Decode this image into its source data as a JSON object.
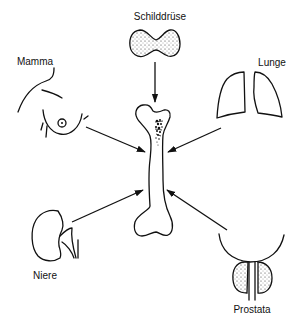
{
  "diagram": {
    "center": {
      "name": "Knochen (Femur)"
    },
    "sources": [
      {
        "id": "thyroid",
        "label": "Schilddrüse",
        "position": "top"
      },
      {
        "id": "breast",
        "label": "Mamma",
        "position": "top-left"
      },
      {
        "id": "lung",
        "label": "Lunge",
        "position": "top-right"
      },
      {
        "id": "kidney",
        "label": "Niere",
        "position": "bottom-left"
      },
      {
        "id": "prostate",
        "label": "Prostata",
        "position": "bottom-right"
      }
    ],
    "edges": [
      {
        "from": "thyroid",
        "to": "bone"
      },
      {
        "from": "breast",
        "to": "bone"
      },
      {
        "from": "lung",
        "to": "bone"
      },
      {
        "from": "kidney",
        "to": "bone"
      },
      {
        "from": "prostate",
        "to": "bone"
      }
    ],
    "colors": {
      "stroke": "#111111",
      "background": "#ffffff"
    }
  }
}
